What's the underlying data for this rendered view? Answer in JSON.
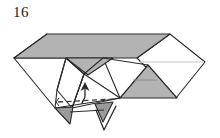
{
  "figure": {
    "step_number": "16",
    "type": "origami-folding-diagram",
    "caption": "",
    "background_color": "#ffffff",
    "line_color": "#2b2b2b",
    "shaded_fill": "#b3b3b3",
    "shaded_fill_dark": "#9a9a9a",
    "shaded_fill_light": "#c8c8c8",
    "white_fill": "#ffffff",
    "highlight_line_color": "#d9d9d9",
    "annotations": {
      "valley_fold_label": "dashed-fold-line",
      "arrow_up_label": "fold-up-arrow",
      "arrow_down_label": "fold-down-arrow"
    },
    "shapes": {
      "top_parallelogram": "M 14,58 L 47,34 L 170,34 L 137,58 Z",
      "left_white_point": "M 14,58 L 47,34 L 47,34 L 14,58 L 57,89 Z",
      "right_white_point": "M 170,34 L 205,62 L 160,96 L 137,58 Z",
      "center_small_triangle": "M 66,58 L 103,58 L 84,74 Z",
      "right_shaded_triangle": "M 120,98 L 148,66 L 176,98 Z",
      "bottom_left_pleat": "M 55,108 L 72,108 L 72,122 Z",
      "bottom_right_pleat": "M 97,108 L 112,108 L 104,124 Z"
    },
    "fold_line": {
      "style": "dashed",
      "y": 102,
      "x_start": 58,
      "x_end": 114
    }
  }
}
